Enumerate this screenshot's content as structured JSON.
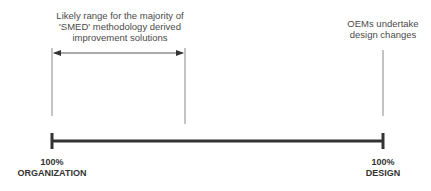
{
  "diagram": {
    "smed_range_label": [
      "Likely range for the majority of",
      "'SMED' methodology derived",
      "improvement solutions"
    ],
    "oem_label": [
      "OEMs undertake",
      "design changes"
    ],
    "left_end": {
      "percent": "100%",
      "name": "ORGANIZATION"
    },
    "right_end": {
      "percent": "100%",
      "name": "DESIGN"
    }
  }
}
